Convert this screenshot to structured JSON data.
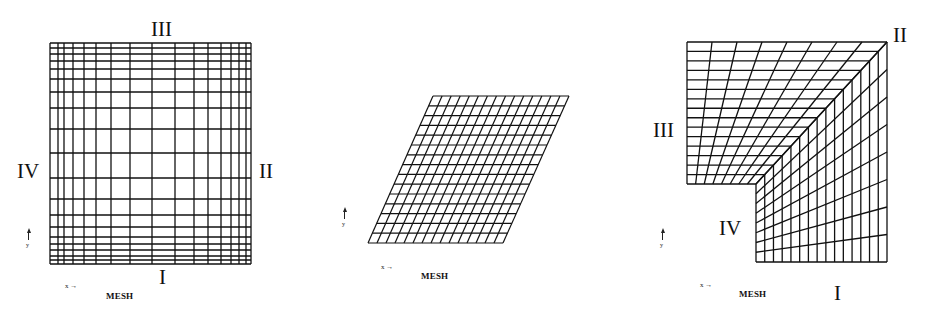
{
  "figure": {
    "background": "#ffffff",
    "line_color": "#111111",
    "panels": [
      {
        "id": "square-mesh",
        "caption": "MESH",
        "axis_x_label": "x",
        "axis_y_label": "y",
        "boundary_labels": {
          "bottom": "I",
          "right": "II",
          "top": "III",
          "left": "IV"
        },
        "shape": "square",
        "x_lines": [
          50,
          58,
          64,
          73,
          84,
          96,
          111,
          130,
          152,
          175,
          194,
          208,
          221,
          231,
          239,
          246,
          251
        ],
        "y_lines": [
          43,
          48,
          54,
          61,
          69,
          79,
          92,
          108,
          129,
          153,
          178,
          199,
          215,
          227,
          237,
          244,
          250,
          256,
          260,
          264
        ]
      },
      {
        "id": "parallelogram-mesh",
        "caption": "MESH",
        "axis_x_label": "x",
        "axis_y_label": "y",
        "shape": "parallelogram",
        "corners": {
          "top_left": [
            433,
            96
          ],
          "top_right": [
            569,
            96
          ],
          "bottom_left": [
            368,
            243
          ],
          "bottom_right": [
            503,
            243
          ]
        },
        "columns": 15,
        "rows": 15
      },
      {
        "id": "l-shaped-mesh",
        "caption": "MESH",
        "axis_x_label": "x",
        "axis_y_label": "y",
        "boundary_labels": {
          "bottom": "I",
          "corner_top_right": "II",
          "left": "III",
          "inner": "IV"
        },
        "shape": "l-shape",
        "outer_corner": [
          887,
          42
        ],
        "inner_corner": [
          756,
          184
        ],
        "left_x": 687,
        "bottom_y": 262,
        "divisions_along_arm": 15,
        "divisions_across_arm": 8
      }
    ]
  }
}
